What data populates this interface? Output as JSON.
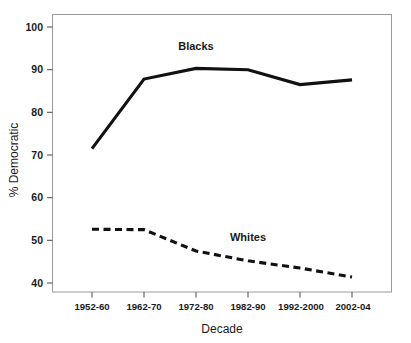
{
  "chart_data": {
    "type": "line",
    "title": "",
    "xlabel": "Decade",
    "ylabel": "% Democratic",
    "categories": [
      "1952-60",
      "1962-70",
      "1972-80",
      "1982-90",
      "1992-2000",
      "2002-04"
    ],
    "ylim": [
      37,
      103
    ],
    "yticks": [
      40,
      50,
      60,
      70,
      80,
      90,
      100
    ],
    "ytick_labels": [
      "40",
      "50",
      "60",
      "70",
      "80",
      "90",
      "100"
    ],
    "grid": false,
    "legend_position": "inline-annotations",
    "series": [
      {
        "name": "Blacks",
        "style": "solid",
        "color": "#111111",
        "values": [
          71.5,
          87.8,
          90.3,
          90.0,
          86.5,
          87.6
        ],
        "annotation": {
          "text": "Blacks",
          "x_category": "1972-80",
          "y_value": 94.5
        }
      },
      {
        "name": "Whites",
        "style": "dashed",
        "color": "#111111",
        "values": [
          52.6,
          52.5,
          47.5,
          45.2,
          43.5,
          41.4
        ],
        "annotation": {
          "text": "Whites",
          "x_category": "1982-90",
          "y_value": 49.8
        }
      }
    ]
  },
  "axes": {
    "y_title": "% Democratic",
    "x_title": "Decade",
    "y_tick_labels": [
      "100",
      "90",
      "80",
      "70",
      "60",
      "50",
      "40"
    ],
    "x_tick_labels": [
      "1952-60",
      "1962-70",
      "1972-80",
      "1982-90",
      "1992-2000",
      "2002-04"
    ]
  },
  "annotations": {
    "blacks_label": "Blacks",
    "whites_label": "Whites"
  }
}
